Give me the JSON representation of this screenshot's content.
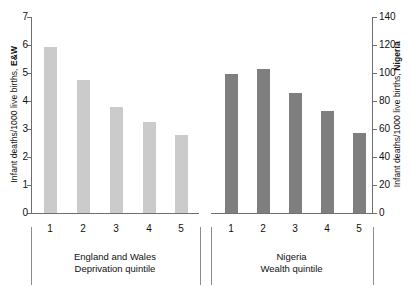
{
  "chart_data": {
    "type": "bar",
    "title": "",
    "categories": [
      "1",
      "2",
      "3",
      "4",
      "5"
    ],
    "series": [
      {
        "name": "England and Wales",
        "axis": "left",
        "color": "#cbcbcb",
        "group_label": "England and Wales",
        "group_sublabel": "Deprivation quintile",
        "values": [
          5.93,
          4.75,
          3.78,
          3.25,
          2.79
        ]
      },
      {
        "name": "Nigeria",
        "axis": "right",
        "color": "#7f7f7f",
        "group_label": "Nigeria",
        "group_sublabel": "Wealth quintile",
        "values": [
          99,
          103,
          86,
          73,
          57
        ]
      }
    ],
    "left_axis": {
      "label_prefix": "Infant deaths/1000 live births, ",
      "label_emphasis": "E&W",
      "ticks": [
        0,
        1,
        2,
        3,
        4,
        5,
        6,
        7
      ],
      "ylim": [
        0,
        7
      ]
    },
    "right_axis": {
      "label_prefix": "Infant deaths/1000 live births, ",
      "label_emphasis": "Nigeria",
      "ticks": [
        0,
        20,
        40,
        60,
        80,
        100,
        120,
        140
      ],
      "ylim": [
        0,
        140
      ]
    },
    "grid": false,
    "legend": "none",
    "xlabel": "",
    "ylabel": "Infant deaths/1000 live births"
  }
}
